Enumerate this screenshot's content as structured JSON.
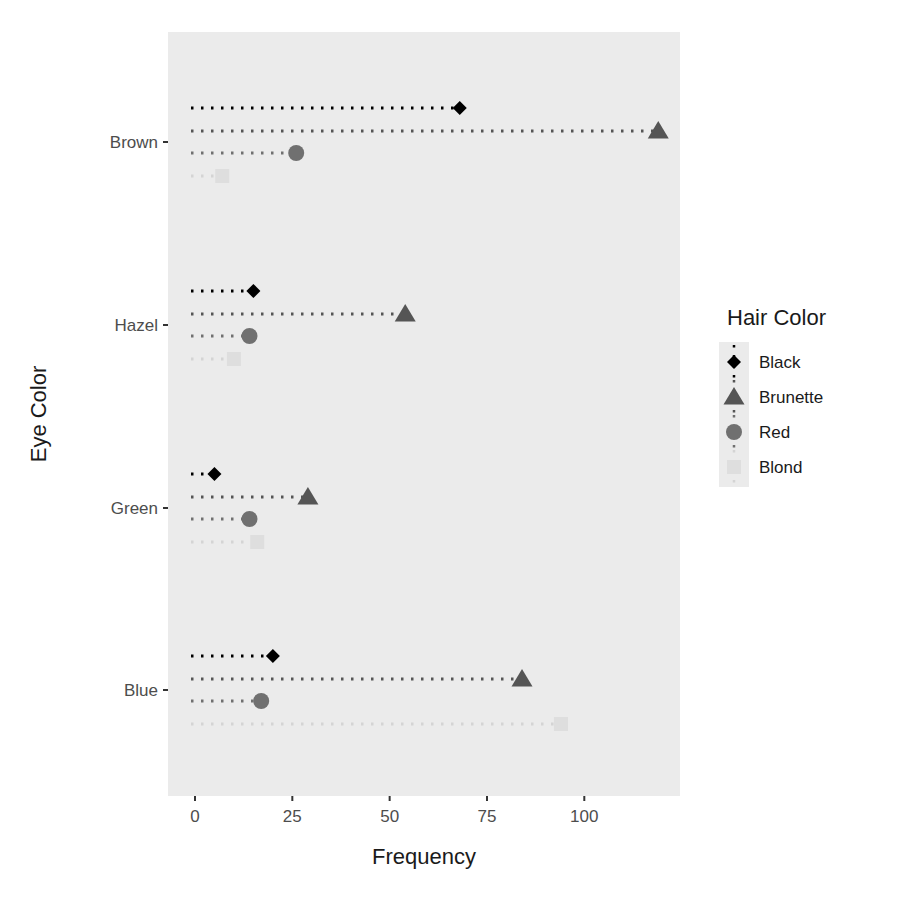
{
  "chart_data": {
    "type": "scatter",
    "subtype": "dot-plot with dotted leader lines",
    "title": "",
    "xlabel": "Frequency",
    "ylabel": "Eye Color",
    "xlim": [
      -6,
      125
    ],
    "x_ticks": [
      0,
      25,
      50,
      75,
      100
    ],
    "x_tick_labels": [
      "0",
      "25",
      "50",
      "75",
      "100"
    ],
    "categories": [
      "Blue",
      "Green",
      "Hazel",
      "Brown"
    ],
    "grid": false,
    "legend": {
      "title": "Hair Color",
      "position": "right"
    },
    "series": [
      {
        "name": "Black",
        "shape": "diamond",
        "color": "#000000",
        "values": [
          20,
          5,
          15,
          68
        ]
      },
      {
        "name": "Brunette",
        "shape": "triangle",
        "color": "#555555",
        "values": [
          84,
          29,
          54,
          119
        ]
      },
      {
        "name": "Red",
        "shape": "circle",
        "color": "#707070",
        "values": [
          17,
          14,
          14,
          26
        ]
      },
      {
        "name": "Blond",
        "shape": "square",
        "color": "#dedede",
        "values": [
          94,
          16,
          10,
          7
        ]
      }
    ],
    "panel_background": "#ebebeb"
  }
}
